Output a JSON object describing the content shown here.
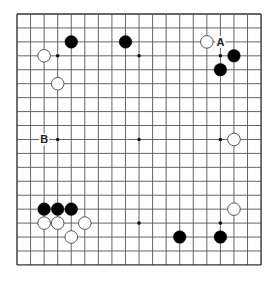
{
  "board": {
    "size": 19,
    "origin_x": 17,
    "origin_y": 14,
    "step_x": 13.56,
    "step_y": 13.94,
    "line_color": "#555555",
    "border_color": "#333333",
    "star_points": [
      [
        3,
        3
      ],
      [
        9,
        3
      ],
      [
        15,
        3
      ],
      [
        3,
        9
      ],
      [
        9,
        9
      ],
      [
        15,
        9
      ],
      [
        3,
        15
      ],
      [
        9,
        15
      ],
      [
        15,
        15
      ]
    ],
    "stones": [
      {
        "color": "black",
        "col": 4,
        "row": 2
      },
      {
        "color": "black",
        "col": 8,
        "row": 2
      },
      {
        "color": "white",
        "col": 2,
        "row": 3
      },
      {
        "color": "white",
        "col": 3,
        "row": 5
      },
      {
        "color": "white",
        "col": 14,
        "row": 2
      },
      {
        "color": "black",
        "col": 16,
        "row": 3
      },
      {
        "color": "black",
        "col": 15,
        "row": 4
      },
      {
        "color": "white",
        "col": 16,
        "row": 9
      },
      {
        "color": "black",
        "col": 2,
        "row": 14
      },
      {
        "color": "black",
        "col": 3,
        "row": 14
      },
      {
        "color": "black",
        "col": 4,
        "row": 14
      },
      {
        "color": "white",
        "col": 2,
        "row": 15
      },
      {
        "color": "white",
        "col": 3,
        "row": 15
      },
      {
        "color": "white",
        "col": 5,
        "row": 15
      },
      {
        "color": "white",
        "col": 4,
        "row": 16
      },
      {
        "color": "white",
        "col": 16,
        "row": 14
      },
      {
        "color": "black",
        "col": 12,
        "row": 16
      },
      {
        "color": "black",
        "col": 15,
        "row": 16
      }
    ],
    "labels": [
      {
        "text": "A",
        "col": 15,
        "row": 2
      },
      {
        "text": "B",
        "col": 2,
        "row": 9
      }
    ]
  }
}
